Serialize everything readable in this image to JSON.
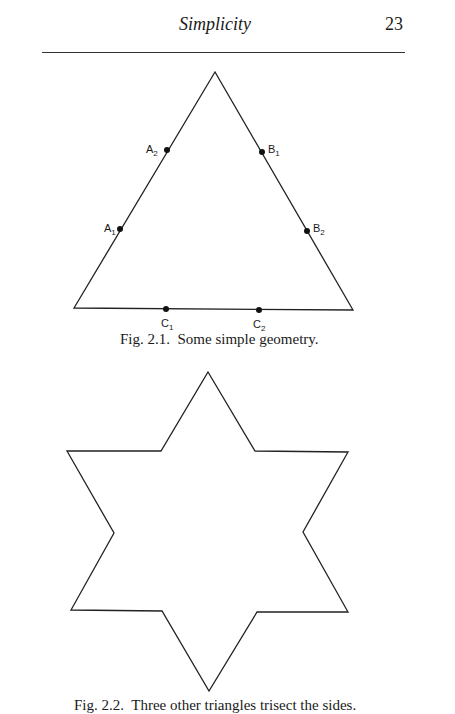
{
  "header": {
    "running_title": "Simplicity",
    "page_number": "23"
  },
  "figure_1": {
    "caption": "Fig. 2.1.  Some simple geometry.",
    "triangle": {
      "apex": [
        215,
        72
      ],
      "bottom_left": [
        74,
        308
      ],
      "bottom_right": [
        353,
        310
      ]
    },
    "points": [
      {
        "name": "A",
        "sub": "2",
        "x": 167,
        "y": 150,
        "lx": 146,
        "ly": 153
      },
      {
        "name": "B",
        "sub": "1",
        "x": 262,
        "y": 152,
        "lx": 268,
        "ly": 153
      },
      {
        "name": "A",
        "sub": "1",
        "x": 120,
        "y": 229,
        "lx": 104,
        "ly": 232
      },
      {
        "name": "B",
        "sub": "2",
        "x": 307,
        "y": 231,
        "lx": 313,
        "ly": 232
      },
      {
        "name": "C",
        "sub": "1",
        "x": 166,
        "y": 309,
        "lx": 161,
        "ly": 327
      },
      {
        "name": "C",
        "sub": "2",
        "x": 259,
        "y": 310,
        "lx": 253,
        "ly": 328
      }
    ]
  },
  "figure_2": {
    "caption": "Fig. 2.2.  Three other triangles trisect the sides.",
    "star_points": "208,372 255,451 348,452 303,532 348,612 257,612 209,691 162,611 71,610 114,533 67,451 161,451"
  }
}
